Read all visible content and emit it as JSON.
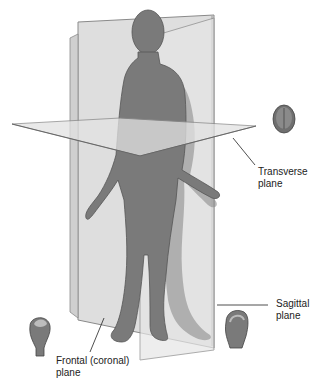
{
  "diagram": {
    "labels": [
      {
        "id": "transverse",
        "line1": "Transverse",
        "line2": "plane"
      },
      {
        "id": "sagittal",
        "line1": "Sagittal",
        "line2": "plane"
      },
      {
        "id": "frontal",
        "line1": "Frontal (coronal)",
        "line2": "plane"
      }
    ],
    "icons": [
      {
        "id": "transverse-head",
        "view": "top-down brain section"
      },
      {
        "id": "sagittal-head",
        "view": "side brain section"
      },
      {
        "id": "frontal-head",
        "view": "front brain section"
      }
    ],
    "colors": {
      "body": "#7a7a7a",
      "plane": "#d8d8d8",
      "plane_edge": "#8a8a8a",
      "text": "#222222"
    }
  }
}
